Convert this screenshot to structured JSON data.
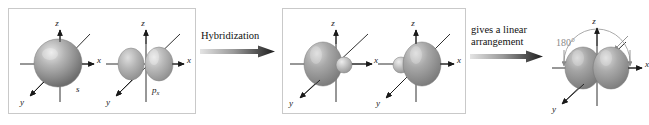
{
  "figure": {
    "type": "chemistry-orbital-diagram",
    "background_color": "#ffffff",
    "panel_border_color": "#c9c9c9",
    "orbital_color": "#8f8f8f",
    "orbital_highlight_color": "#e2e2e2",
    "axis_color": "#1a1a1a",
    "angle_color": "#8a8a8a"
  },
  "panels": [
    {
      "id": "panel-1",
      "name": "atomic-orbitals-panel",
      "orbitals": [
        {
          "id": "s-orbital",
          "label": "s",
          "shape": "sphere",
          "axes": {
            "z": "z",
            "x": "x",
            "y": "y"
          }
        },
        {
          "id": "px-orbital",
          "label": "p",
          "label_subscript": "x",
          "shape": "two-lobe",
          "axes": {
            "z": "z",
            "x": "x",
            "y": "y"
          }
        }
      ]
    },
    {
      "id": "panel-2",
      "name": "hybrid-orbitals-panel",
      "orbitals": [
        {
          "id": "sp-orbital-left",
          "label": "",
          "shape": "sp-hybrid-pointing-minus-x",
          "axes": {
            "z": "z",
            "x": "x",
            "y": "y"
          }
        },
        {
          "id": "sp-orbital-right",
          "label": "",
          "shape": "sp-hybrid-pointing-plus-x",
          "axes": {
            "z": "z",
            "x": "x",
            "y": "y"
          }
        }
      ]
    },
    {
      "id": "panel-3",
      "name": "linear-arrangement-panel",
      "bordered": false,
      "orbitals": [
        {
          "id": "sp-pair-linear",
          "label": "",
          "shape": "two-sp-hybrids-opposed",
          "angle_label": "180°",
          "axes": {
            "z": "z",
            "x": "x",
            "y": "y"
          }
        }
      ]
    }
  ],
  "arrows": [
    {
      "id": "arrow-1",
      "name": "hybridization-arrow",
      "lines": [
        "Hybridization"
      ],
      "direction": "right",
      "style": "gradient-light-to-dark"
    },
    {
      "id": "arrow-2",
      "name": "linear-arrangement-arrow",
      "lines": [
        "gives a linear",
        "arrangement"
      ],
      "direction": "right",
      "style": "gradient-light-to-dark"
    }
  ],
  "labels": {
    "axis_z": "z",
    "axis_x": "x",
    "axis_y": "y",
    "s_orbital": "s",
    "p_orbital": "p",
    "p_orbital_subscript": "x",
    "bond_angle": "180°"
  }
}
